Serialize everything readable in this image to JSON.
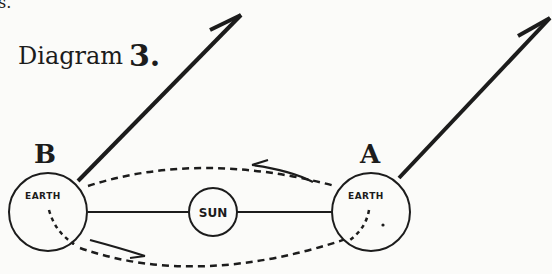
{
  "diagram": {
    "title": "Diagram",
    "title_number": "3.",
    "top_left_fragment": "s.",
    "bodies": [
      {
        "id": "B",
        "label": "B",
        "name": "EARTH"
      },
      {
        "id": "sun",
        "name": "SUN"
      },
      {
        "id": "A",
        "label": "A",
        "name": "EARTH"
      }
    ],
    "arrows": [
      {
        "from": "B",
        "direction": "up-right"
      },
      {
        "from": "A",
        "direction": "up-right"
      }
    ],
    "orbit": {
      "style": "dashed",
      "direction_arrows": [
        "top: right-to-left",
        "bottom: left-to-right"
      ]
    },
    "colors": {
      "ink": "#1c1c1c",
      "paper": "#fbfbf9"
    }
  }
}
